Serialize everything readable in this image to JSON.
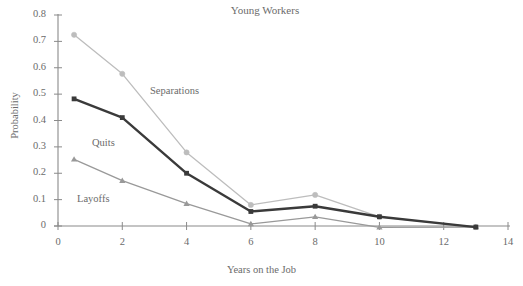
{
  "chart_data": {
    "type": "line",
    "title": "Young Workers",
    "xlabel": "Years on the Job",
    "ylabel": "Probability",
    "xlim": [
      0,
      14
    ],
    "ylim": [
      0,
      0.8
    ],
    "xticks": [
      0,
      2,
      4,
      6,
      8,
      10,
      12,
      14
    ],
    "xtick_labels": [
      "0",
      "2",
      "4",
      "6",
      "8",
      "10",
      "12",
      "14"
    ],
    "yticks": [
      0,
      0.1,
      0.2,
      0.3,
      0.4,
      0.5,
      0.6,
      0.7,
      0.8
    ],
    "ytick_labels": [
      "0",
      "0.1",
      "0.2",
      "0.3",
      "0.4",
      "0.5",
      "0.6",
      "0.7",
      "0.8"
    ],
    "grid": false,
    "legend": "inline-annotations",
    "series": [
      {
        "name": "Separations",
        "marker": "circle",
        "color": "#bdbdbd",
        "label_x": 150,
        "label_y": 85,
        "x": [
          0.5,
          2,
          4,
          6,
          8,
          10,
          13
        ],
        "values": [
          0.725,
          0.577,
          0.279,
          0.08,
          0.118,
          0.035,
          -0.004
        ]
      },
      {
        "name": "Quits",
        "marker": "square",
        "color": "#3a3a3a",
        "label_x": 92,
        "label_y": 137,
        "x": [
          0.5,
          2,
          4,
          6,
          8,
          10,
          13
        ],
        "values": [
          0.482,
          0.411,
          0.2,
          0.055,
          0.075,
          0.035,
          -0.004
        ]
      },
      {
        "name": "Layoffs",
        "marker": "triangle",
        "color": "#999999",
        "label_x": 77,
        "label_y": 193,
        "x": [
          0.5,
          2,
          4,
          6,
          8,
          10,
          13
        ],
        "values": [
          0.253,
          0.172,
          0.085,
          0.008,
          0.035,
          -0.005,
          -0.004
        ]
      }
    ]
  },
  "colors": {
    "axis": "#8a8a8a",
    "text": "#6b6b6b",
    "background": "#ffffff",
    "separations": "#bdbdbd",
    "quits": "#3a3a3a",
    "layoffs": "#999999"
  }
}
